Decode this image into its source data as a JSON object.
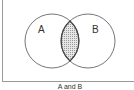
{
  "diagram": {
    "type": "venn",
    "sets": [
      {
        "label": "A"
      },
      {
        "label": "B"
      }
    ],
    "shaded_region": "intersection",
    "caption": "A and B",
    "colors": {
      "outline": "#666666",
      "shade": "#bdbdbd",
      "frame": "#9a9a9a"
    }
  }
}
